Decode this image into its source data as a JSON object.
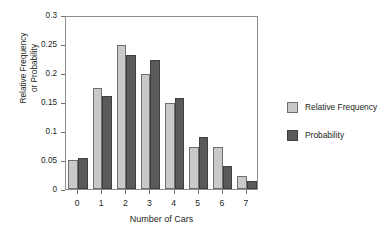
{
  "chart_data": {
    "type": "bar",
    "title": "",
    "xlabel": "Number of Cars",
    "ylabel": "Relative Frequency or Probability",
    "ylabel_lines": [
      "Relative Frequency",
      "or Probability"
    ],
    "categories": [
      "0",
      "1",
      "2",
      "3",
      "4",
      "5",
      "6",
      "7"
    ],
    "series": [
      {
        "name": "Relative Frequency",
        "color": "#c9c9c9",
        "values": [
          0.05,
          0.174,
          0.249,
          0.198,
          0.148,
          0.072,
          0.072,
          0.022
        ]
      },
      {
        "name": "Probability",
        "color": "#5a5a5a",
        "values": [
          0.054,
          0.16,
          0.231,
          0.222,
          0.157,
          0.089,
          0.04,
          0.014
        ]
      }
    ],
    "ylim": [
      0,
      0.3
    ],
    "yticks": [
      0,
      0.05,
      0.1,
      0.15,
      0.2,
      0.25,
      0.3
    ],
    "ytick_labels": [
      "0",
      "0.05",
      "0.1",
      "0.15",
      "0.2",
      "0.25",
      "0.3"
    ],
    "grid": false,
    "legend_position": "right",
    "legend_entries": [
      "Relative Frequency",
      "Probability"
    ]
  },
  "legend": {
    "items": [
      {
        "label": "Relative Frequency",
        "swatch": "rf"
      },
      {
        "label": "Probability",
        "swatch": "pr"
      }
    ]
  }
}
